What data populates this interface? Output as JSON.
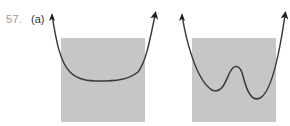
{
  "problem": {
    "number": "57.",
    "part": "(a)"
  },
  "colors": {
    "shade": "#c6c6c6",
    "curve": "#3a3a3a",
    "label_number": "#9a9a9a",
    "label_part": "#333333"
  },
  "figures": [
    {
      "name": "flat-bottom-curve",
      "description": "Curve with a single wide flat minimum over a shaded square; both ends rise with arrows"
    },
    {
      "name": "double-well-curve",
      "description": "Curve with two local minima and one local maximum over a shaded square; both ends rise with arrows"
    }
  ]
}
